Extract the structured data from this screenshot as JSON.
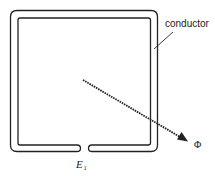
{
  "diagram": {
    "type": "loop-conductor-flux",
    "labels": {
      "conductor": "conductor",
      "flux_symbol": "Φ",
      "emf_symbol": "E",
      "emf_subscript": "1"
    },
    "colors": {
      "stroke": "#222222",
      "background": "#ffffff"
    }
  }
}
